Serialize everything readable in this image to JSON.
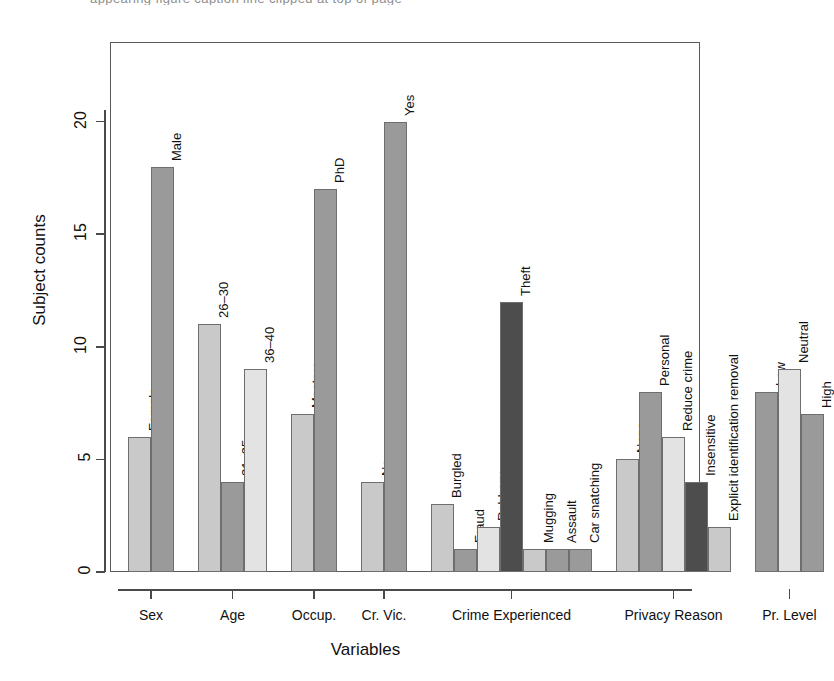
{
  "figure": {
    "caption_fragment": "appearing figure caption line clipped at top of page",
    "axis": {
      "x_title": "Variables",
      "y_title": "Subject counts",
      "y_ticks": [
        "0",
        "5",
        "10",
        "15",
        "20"
      ],
      "y_tick_values": [
        0,
        5,
        10,
        15,
        20
      ],
      "y_min": 0,
      "y_max": 22
    }
  },
  "chart_data": {
    "type": "bar",
    "title": "",
    "xlabel": "Variables",
    "ylabel": "Subject counts",
    "ylim": [
      0,
      22
    ],
    "yticks": [
      0,
      5,
      10,
      15,
      20
    ],
    "grid": false,
    "legend": "none",
    "orientation": "vertical",
    "bar_label_rotation": -90,
    "colors": {
      "light": "#c9c9c9",
      "medium": "#9a9a9a",
      "lightest": "#e3e3e3",
      "dark": "#4d4d4d",
      "outline": "#6e6e6e"
    },
    "groups": [
      {
        "name": "Sex",
        "categories": [
          "Female",
          "Male"
        ],
        "values": [
          6,
          18
        ],
        "shades": [
          "light",
          "medium"
        ]
      },
      {
        "name": "Age",
        "categories": [
          "26–30",
          "31–35",
          "36–40"
        ],
        "values": [
          11,
          4,
          9
        ],
        "shades": [
          "light",
          "medium",
          "lightest"
        ]
      },
      {
        "name": "Occup.",
        "categories": [
          "Masters",
          "PhD"
        ],
        "values": [
          7,
          17
        ],
        "shades": [
          "light",
          "medium"
        ]
      },
      {
        "name": "Cr. Vic.",
        "categories": [
          "No",
          "Yes"
        ],
        "values": [
          4,
          20
        ],
        "shades": [
          "light",
          "medium"
        ]
      },
      {
        "name": "Crime Experienced",
        "categories": [
          "Burgled",
          "Fraud",
          "Robbery",
          "Theft",
          "Mugging",
          "Assault",
          "Car snatching"
        ],
        "values": [
          3,
          1,
          2,
          12,
          1,
          1,
          1
        ],
        "shades": [
          "light",
          "medium",
          "lightest",
          "dark",
          "light",
          "medium",
          "medium"
        ]
      },
      {
        "name": "Privacy Reason",
        "categories": [
          "None",
          "Personal",
          "Reduce crime",
          "Insensitive",
          "Explicit identification removal"
        ],
        "values": [
          5,
          8,
          6,
          4,
          2
        ],
        "shades": [
          "light",
          "medium",
          "lightest",
          "dark",
          "light"
        ]
      },
      {
        "name": "Pr. Level",
        "categories": [
          "Low",
          "Neutral",
          "High"
        ],
        "values": [
          8,
          9,
          7
        ],
        "shades": [
          "medium",
          "lightest",
          "medium"
        ]
      }
    ]
  }
}
